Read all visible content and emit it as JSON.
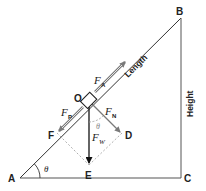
{
  "diagram": {
    "points": {
      "A": "A",
      "B": "B",
      "C": "C",
      "O": "O",
      "D": "D",
      "E": "E",
      "F": "F"
    },
    "sides": {
      "hypotenuse": "Length",
      "vertical": "Height"
    },
    "forces": {
      "applied": {
        "symbol": "F",
        "subscript": "A"
      },
      "parallel": {
        "symbol": "F",
        "subscript": "P"
      },
      "normal": {
        "symbol": "F",
        "subscript": "N"
      },
      "weight": {
        "symbol": "F",
        "subscript": "W"
      }
    },
    "angles": {
      "base": "θ",
      "force": "θ"
    },
    "colors": {
      "structure": "#333333",
      "force_vector": "#7a7a7a",
      "weight_vector": "#111111",
      "construction_dashed": "#9a9a9a"
    }
  }
}
